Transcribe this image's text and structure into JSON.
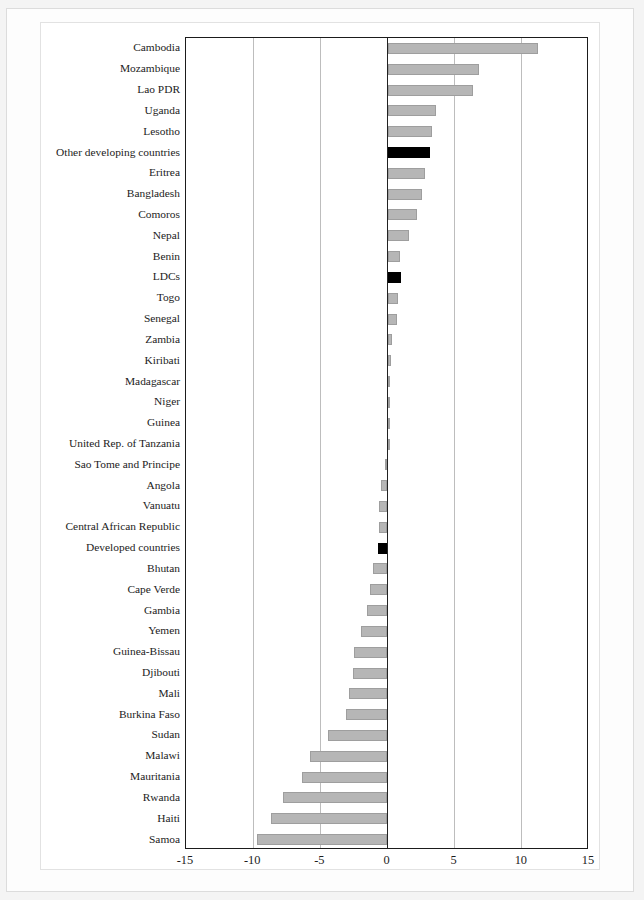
{
  "figure": {
    "top_caption_fragment": "",
    "background_color": "#f4f4f4",
    "panel_color": "#ffffff",
    "bar_color": "#b6b6b6",
    "highlight_color": "#000000",
    "axis_color": "#1b1b1b",
    "grid_color": "#bdbdbd"
  },
  "chart_data": {
    "type": "bar",
    "orientation": "horizontal",
    "title": "",
    "subtitle": "",
    "xlabel": "",
    "ylabel": "",
    "xlim": [
      -15,
      15
    ],
    "xticks": [
      -15,
      -10,
      -5,
      0,
      5,
      10,
      15
    ],
    "xtick_labels": [
      "-15",
      "-10",
      "-5",
      "0",
      "5",
      "10",
      "15"
    ],
    "grid": true,
    "legend": null,
    "highlight_categories": [
      "Other developing countries",
      "LDCs",
      "Developed countries"
    ],
    "categories": [
      "Cambodia",
      "Mozambique",
      "Lao PDR",
      "Uganda",
      "Lesotho",
      "Other developing countries",
      "Eritrea",
      "Bangladesh",
      "Comoros",
      "Nepal",
      "Benin",
      "LDCs",
      "Togo",
      "Senegal",
      "Zambia",
      "Kiribati",
      "Madagascar",
      "Niger",
      "Guinea",
      "United Rep. of Tanzania",
      "Sao Tome and Principe",
      "Angola",
      "Vanuatu",
      "Central African Republic",
      "Developed countries",
      "Bhutan",
      "Cape Verde",
      "Gambia",
      "Yemen",
      "Guinea-Bissau",
      "Djibouti",
      "Mali",
      "Burkina Faso",
      "Sudan",
      "Malawi",
      "Mauritania",
      "Rwanda",
      "Haiti",
      "Samoa"
    ],
    "values": [
      11.2,
      6.8,
      6.4,
      3.6,
      3.3,
      3.2,
      2.8,
      2.6,
      2.2,
      1.6,
      0.9,
      1.0,
      0.8,
      0.7,
      0.35,
      0.25,
      0.15,
      0.1,
      0.05,
      0.05,
      -0.2,
      -0.5,
      -0.6,
      -0.6,
      -0.7,
      -1.1,
      -1.3,
      -1.5,
      -2.0,
      -2.5,
      -2.6,
      -2.9,
      -3.1,
      -4.4,
      -5.8,
      -6.4,
      -7.8,
      -8.7,
      -9.7
    ]
  }
}
